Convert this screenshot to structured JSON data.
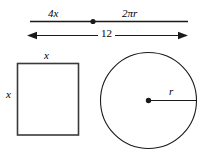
{
  "figure": {
    "stroke_color": "#1a1a1a",
    "background_color": "#ffffff"
  },
  "top_segment": {
    "left_label": "4x",
    "right_label": "2πr",
    "total_label": "12",
    "midpoint_marker": "dot"
  },
  "square": {
    "top_side_label": "x",
    "left_side_label": "x"
  },
  "circle": {
    "radius_label": "r",
    "center_marker": "dot"
  }
}
